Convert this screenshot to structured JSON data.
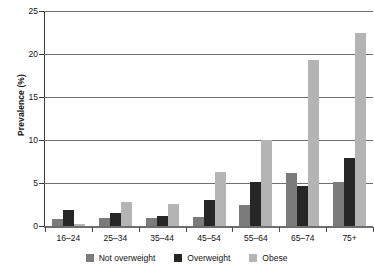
{
  "chart_data": {
    "type": "bar",
    "title": "",
    "xlabel": "",
    "ylabel": "Prevalence (%)",
    "ylim": [
      0,
      25
    ],
    "yticks": [
      0,
      5,
      10,
      15,
      20,
      25
    ],
    "grid": true,
    "legend_position": "bottom",
    "categories": [
      "16–24",
      "25–34",
      "35–44",
      "45–54",
      "55–64",
      "65–74",
      "75+"
    ],
    "series": [
      {
        "name": "Not overweight",
        "color": "#7b7b7b",
        "values": [
          0.8,
          0.9,
          0.9,
          1.0,
          2.4,
          6.2,
          5.1
        ]
      },
      {
        "name": "Overweight",
        "color": "#262626",
        "values": [
          1.9,
          1.5,
          1.2,
          3.0,
          5.1,
          4.7,
          7.9
        ]
      },
      {
        "name": "Obese",
        "color": "#b4b4b4",
        "values": [
          0.2,
          2.8,
          2.6,
          6.3,
          10.0,
          19.3,
          22.5
        ]
      }
    ]
  },
  "axes": {
    "y_title": "Prevalence (%)",
    "y_tick_labels": [
      "25",
      "20",
      "15",
      "10",
      "5",
      "0"
    ]
  },
  "legend": {
    "items": [
      {
        "label": "Not overweight",
        "color": "#7b7b7b"
      },
      {
        "label": "Overweight",
        "color": "#262626"
      },
      {
        "label": "Obese",
        "color": "#b4b4b4"
      }
    ]
  }
}
